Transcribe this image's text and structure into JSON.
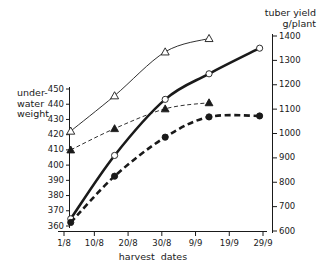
{
  "figure": {
    "left_axis_title": "under-\nwater\nweight",
    "right_axis_title": "tuber yield\ng/plant",
    "x_axis_title": "harvest  dates"
  },
  "chart_data": {
    "type": "line",
    "title": "",
    "xlabel": "harvest  dates",
    "ylabel": "under-water weight",
    "y2label": "tuber yield g/plant",
    "grid": false,
    "legend": "none",
    "x_tick_labels": [
      "1/8",
      "10/8",
      "20/8",
      "30/8",
      "9/9",
      "19/9",
      "29/9"
    ],
    "x_tick_values": [
      0,
      9,
      19,
      29,
      39,
      49,
      59
    ],
    "xlim": [
      0,
      59
    ],
    "y_left_ticks": [
      360,
      370,
      380,
      390,
      400,
      410,
      420,
      430,
      440,
      450
    ],
    "ylim_left": [
      360,
      450
    ],
    "y_right_ticks": [
      600,
      700,
      800,
      900,
      1000,
      1100,
      1200,
      1300,
      1400
    ],
    "ylim_right": [
      600,
      1400
    ],
    "series": [
      {
        "name": "open-triangle",
        "marker": "triangle-open",
        "line": "thin-solid",
        "axis": "right",
        "x": [
          2,
          15,
          30,
          43
        ],
        "values": [
          1010,
          1155,
          1335,
          1390
        ]
      },
      {
        "name": "open-circle",
        "marker": "circle-open",
        "line": "thick-solid",
        "axis": "right",
        "x": [
          2,
          15,
          30,
          43,
          58
        ],
        "values": [
          650,
          910,
          1140,
          1245,
          1350
        ]
      },
      {
        "name": "filled-circle",
        "marker": "circle-filled",
        "line": "thick-dashed",
        "axis": "right",
        "x": [
          2,
          15,
          30,
          43,
          58
        ],
        "values": [
          635,
          825,
          985,
          1068,
          1072
        ]
      },
      {
        "name": "filled-triangle",
        "marker": "triangle-filled",
        "line": "thin-dashed",
        "axis": "left",
        "x": [
          2,
          15,
          30,
          43
        ],
        "values": [
          410,
          424,
          437,
          441
        ]
      }
    ]
  }
}
